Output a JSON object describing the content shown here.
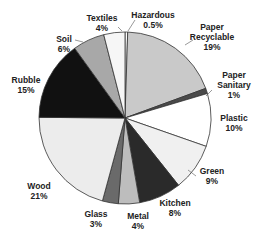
{
  "chart_data": {
    "type": "pie",
    "title": "",
    "start_angle": "12 o'clock",
    "direction": "clockwise",
    "legend": "none (data labels outside slices)",
    "slices": [
      {
        "label": "Hazardous",
        "value": 0.5,
        "display": "0.5%",
        "color": "#ffffff"
      },
      {
        "label": "Paper Recyclable",
        "value": 19,
        "display": "19%",
        "color": "#c9c9c9"
      },
      {
        "label": "Paper Sanitary",
        "value": 1,
        "display": "1%",
        "color": "#4a4a4a"
      },
      {
        "label": "Plastic",
        "value": 10,
        "display": "10%",
        "color": "#ffffff"
      },
      {
        "label": "Green",
        "value": 9,
        "display": "9%",
        "color": "#f0f0f0"
      },
      {
        "label": "Kitchen",
        "value": 8,
        "display": "8%",
        "color": "#2a2a2a"
      },
      {
        "label": "Metal",
        "value": 4,
        "display": "4%",
        "color": "#bdbdbd"
      },
      {
        "label": "Glass",
        "value": 3,
        "display": "3%",
        "color": "#6a6a6a"
      },
      {
        "label": "Wood",
        "value": 21,
        "display": "21%",
        "color": "#ececec"
      },
      {
        "label": "Rubble",
        "value": 15,
        "display": "15%",
        "color": "#111111"
      },
      {
        "label": "Soil",
        "value": 6,
        "display": "6%",
        "color": "#a8a8a8"
      },
      {
        "label": "Textiles",
        "value": 4,
        "display": "4%",
        "color": "#f6f6f6"
      }
    ]
  },
  "labels": [
    {
      "name": "Hazardous",
      "lines": [
        "Hazardous",
        "0.5%"
      ],
      "x": 153,
      "y": 10
    },
    {
      "name": "Paper Recyclable",
      "lines": [
        "Paper",
        "Recyclable",
        "19%"
      ],
      "x": 212,
      "y": 22
    },
    {
      "name": "Paper Sanitary",
      "lines": [
        "Paper",
        "Sanitary",
        "1%"
      ],
      "x": 234,
      "y": 70
    },
    {
      "name": "Plastic",
      "lines": [
        "Plastic",
        "10%"
      ],
      "x": 234,
      "y": 113
    },
    {
      "name": "Green",
      "lines": [
        "Green",
        "9%"
      ],
      "x": 212,
      "y": 166
    },
    {
      "name": "Kitchen",
      "lines": [
        "Kitchen",
        "8%"
      ],
      "x": 175,
      "y": 198
    },
    {
      "name": "Metal",
      "lines": [
        "Metal",
        "4%"
      ],
      "x": 138,
      "y": 211
    },
    {
      "name": "Glass",
      "lines": [
        "Glass",
        "3%"
      ],
      "x": 96,
      "y": 209
    },
    {
      "name": "Wood",
      "lines": [
        "Wood",
        "21%"
      ],
      "x": 39,
      "y": 181
    },
    {
      "name": "Rubble",
      "lines": [
        "Rubble",
        "15%"
      ],
      "x": 26,
      "y": 75
    },
    {
      "name": "Soil",
      "lines": [
        "Soil",
        "6%"
      ],
      "x": 64,
      "y": 34
    },
    {
      "name": "Textiles",
      "lines": [
        "Textiles",
        "4%"
      ],
      "x": 102,
      "y": 13
    }
  ]
}
